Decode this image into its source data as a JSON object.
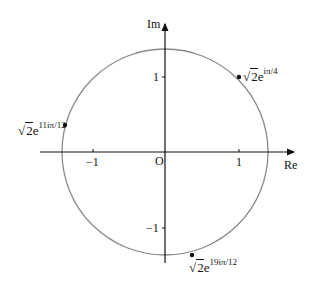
{
  "diagram": {
    "type": "argand-diagram",
    "axes": {
      "x_label": "Re",
      "y_label": "Im",
      "origin_label": "O",
      "x_ticks": [
        "−1",
        "1"
      ],
      "y_ticks": [
        "1",
        "−1"
      ]
    },
    "circle": {
      "center": [
        0,
        0
      ],
      "radius": "√2",
      "color": "#808080"
    },
    "points": [
      {
        "label_coef": "2",
        "label_base": "e",
        "label_exp": "iπ/4",
        "re": 1.0,
        "im": 1.0
      },
      {
        "label_coef": "2",
        "label_base": "e",
        "label_exp": "11iπ/12",
        "re": -1.366,
        "im": 0.366
      },
      {
        "label_coef": "2",
        "label_base": "e",
        "label_exp": "19iπ/12",
        "re": 0.366,
        "im": -1.366
      }
    ]
  }
}
